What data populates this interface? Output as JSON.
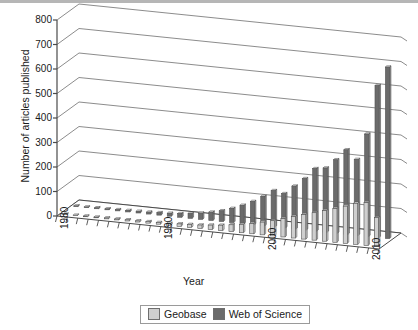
{
  "chart_data": {
    "type": "bar",
    "title": "",
    "xlabel": "Year",
    "ylabel": "Number of articles published",
    "ylim": [
      0,
      800
    ],
    "ytick_values": [
      0,
      100,
      200,
      300,
      400,
      500,
      600,
      700,
      800
    ],
    "ytick_labels": [
      "0",
      "100",
      "200",
      "300",
      "400",
      "500",
      "600",
      "700",
      "800"
    ],
    "xtick_labels": [
      "1980",
      "1990",
      "2000",
      "2010"
    ],
    "xtick_years": [
      1980,
      1990,
      2000,
      2010
    ],
    "grid": true,
    "projection": "3d-perspective",
    "legend_position": "bottom-center",
    "categories": [
      1980,
      1981,
      1982,
      1983,
      1984,
      1985,
      1986,
      1987,
      1988,
      1989,
      1990,
      1991,
      1992,
      1993,
      1994,
      1995,
      1996,
      1997,
      1998,
      1999,
      2000,
      2001,
      2002,
      2003,
      2004,
      2005,
      2006,
      2007,
      2008,
      2009,
      2010
    ],
    "series": [
      {
        "name": "Geobase",
        "color": "#cfcfcf",
        "values": [
          2,
          2,
          3,
          3,
          4,
          4,
          5,
          5,
          6,
          7,
          8,
          10,
          12,
          14,
          18,
          22,
          28,
          34,
          42,
          52,
          62,
          75,
          88,
          100,
          112,
          125,
          138,
          152,
          168,
          175,
          118
        ]
      },
      {
        "name": "Web of Science",
        "color": "#6b6b6b",
        "values": [
          3,
          3,
          4,
          4,
          5,
          6,
          7,
          8,
          10,
          12,
          15,
          20,
          26,
          34,
          44,
          58,
          75,
          95,
          120,
          148,
          140,
          175,
          210,
          255,
          262,
          300,
          345,
          310,
          418,
          620,
          700
        ]
      }
    ],
    "legend": [
      {
        "label": "Geobase",
        "swatch": "geobase"
      },
      {
        "label": "Web of Science",
        "swatch": "wos"
      }
    ]
  },
  "colors": {
    "geobase": "#cfcfcf",
    "web_of_science": "#6b6b6b",
    "axis": "#4a4a4a",
    "grid": "#6e6e6e",
    "frame_top": "#b6b6b6"
  }
}
